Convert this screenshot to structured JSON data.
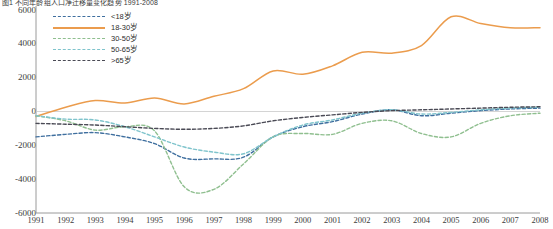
{
  "chart_data": {
    "type": "line",
    "title": "图1 不同年龄组人口净迁移量变化趋势 1991-2008",
    "xlabel": "",
    "ylabel": "",
    "x": [
      1991,
      1992,
      1993,
      1994,
      1995,
      1996,
      1997,
      1998,
      1999,
      2000,
      2001,
      2002,
      2003,
      2004,
      2005,
      2006,
      2007,
      2008
    ],
    "xlim": [
      1991,
      2008
    ],
    "ylim": [
      -6000,
      6000
    ],
    "yticks": [
      6000,
      4000,
      2000,
      0,
      -2000,
      -4000,
      -6000
    ],
    "xticks": [
      "1991",
      "1992",
      "1993",
      "1994",
      "1995",
      "1996",
      "1997",
      "1998",
      "1999",
      "2000",
      "2001",
      "2002",
      "2003",
      "2004",
      "2005",
      "2006",
      "2007",
      "2008"
    ],
    "grid": false,
    "zero_line": true,
    "legend_position": "top-left",
    "series": [
      {
        "name": "<18岁",
        "color": "#3f6f9f",
        "style": "dashed",
        "values": [
          -1500,
          -1350,
          -1250,
          -1500,
          -1900,
          -2750,
          -2800,
          -2700,
          -1500,
          -900,
          -600,
          -150,
          100,
          -250,
          -100,
          50,
          150,
          200
        ]
      },
      {
        "name": "18-30岁",
        "color": "#eb9c4d",
        "style": "solid",
        "values": [
          -300,
          250,
          650,
          500,
          800,
          450,
          900,
          1350,
          2400,
          2200,
          2700,
          3500,
          3450,
          3900,
          5600,
          5200,
          4950,
          4950
        ]
      },
      {
        "name": "30-50岁",
        "color": "#8fbf8f",
        "style": "dashed",
        "values": [
          -250,
          -550,
          -1100,
          -900,
          -1150,
          -4450,
          -4600,
          -3100,
          -1500,
          -1300,
          -1350,
          -700,
          -550,
          -1300,
          -1500,
          -700,
          -250,
          -100
        ]
      },
      {
        "name": "50-65岁",
        "color": "#7fc4cc",
        "style": "dashed",
        "values": [
          -250,
          -450,
          -500,
          -900,
          -1500,
          -2100,
          -2400,
          -2500,
          -1500,
          -800,
          -500,
          -100,
          100,
          -150,
          -50,
          100,
          200,
          250
        ]
      },
      {
        "name": ">65岁",
        "color": "#4a4a55",
        "style": "dashed",
        "values": [
          -700,
          -750,
          -800,
          -900,
          -1000,
          -1050,
          -1000,
          -850,
          -550,
          -350,
          -200,
          -50,
          50,
          100,
          150,
          200,
          250,
          280
        ]
      }
    ]
  }
}
